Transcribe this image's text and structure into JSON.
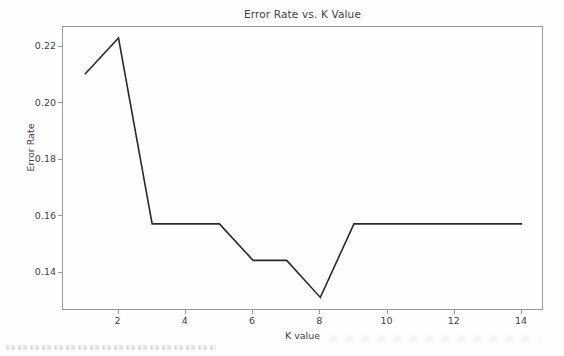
{
  "chart_data": {
    "type": "line",
    "title": "Error Rate vs. K Value",
    "xlabel": "K value",
    "ylabel": "Error Rate",
    "x": [
      1,
      2,
      3,
      4,
      5,
      6,
      7,
      8,
      9,
      10,
      11,
      12,
      13,
      14
    ],
    "values": [
      0.2104,
      0.2232,
      0.1575,
      0.1575,
      0.1575,
      0.1446,
      0.1446,
      0.1315,
      0.1575,
      0.1575,
      0.1575,
      0.1575,
      0.1575,
      0.1575
    ],
    "series": [
      {
        "name": "Error Rate",
        "values": [
          0.2104,
          0.2232,
          0.1575,
          0.1575,
          0.1575,
          0.1446,
          0.1446,
          0.1315,
          0.1575,
          0.1575,
          0.1575,
          0.1575,
          0.1575,
          0.1575
        ]
      }
    ],
    "xticks": [
      2,
      4,
      6,
      8,
      10,
      12,
      14
    ],
    "xtick_labels": [
      "2",
      "4",
      "6",
      "8",
      "10",
      "12",
      "14"
    ],
    "yticks": [
      0.14,
      0.16,
      0.18,
      0.2,
      0.22
    ],
    "ytick_labels": [
      "0.14",
      "0.16",
      "0.18",
      "0.20",
      "0.22"
    ],
    "xlim": [
      0.35,
      14.65
    ],
    "ylim": [
      0.1267,
      0.2271
    ],
    "grid": false,
    "legend": false,
    "legend_position": "none",
    "line_color": "#2b2b2b",
    "line_width": 1.6,
    "marker": "none",
    "background_color": "#fefefe",
    "axes_edge_color": "#9a9a9a",
    "text_color": "#3f3f3f"
  }
}
